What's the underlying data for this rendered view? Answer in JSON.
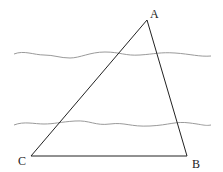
{
  "figure": {
    "type": "geometry-diagram",
    "vertices": {
      "A": {
        "label": "A",
        "x": 147,
        "y": 20
      },
      "B": {
        "label": "B",
        "x": 187,
        "y": 156
      },
      "C": {
        "label": "C",
        "x": 31,
        "y": 156
      }
    },
    "wavy_lines": [
      {
        "name": "upper-bank",
        "y": 55,
        "x_start": 14,
        "x_end": 211
      },
      {
        "name": "lower-bank",
        "y": 124,
        "x_start": 14,
        "x_end": 211
      }
    ],
    "colors": {
      "triangle": "#222222",
      "wavy": "#9a9a9a"
    }
  }
}
